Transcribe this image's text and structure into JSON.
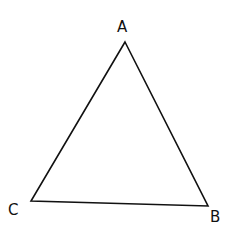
{
  "diagram": {
    "type": "triangle",
    "stroke_color": "#111111",
    "background": "#ffffff",
    "vertices": [
      {
        "name": "A",
        "x": 125,
        "y": 42
      },
      {
        "name": "B",
        "x": 208,
        "y": 206
      },
      {
        "name": "C",
        "x": 31,
        "y": 201
      }
    ],
    "labels": {
      "A": "A",
      "B": "B",
      "C": "C"
    }
  }
}
